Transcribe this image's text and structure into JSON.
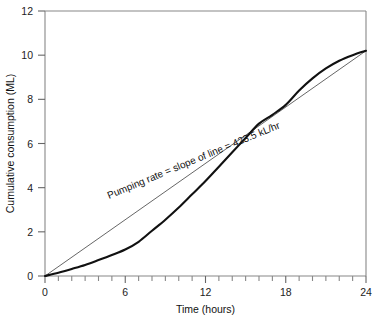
{
  "chart_data": {
    "type": "line",
    "title": "",
    "xlabel": "Time (hours)",
    "ylabel": "Cumulative consumption (ML)",
    "xlim": [
      0,
      24
    ],
    "ylim": [
      0,
      12
    ],
    "x_major_ticks": [
      0,
      6,
      12,
      18,
      24
    ],
    "x_minor_tick_step": 1,
    "y_major_ticks": [
      0,
      2,
      4,
      6,
      8,
      10,
      12
    ],
    "grid": false,
    "legend": "none",
    "x_tick_labels": [
      "0",
      "6",
      "12",
      "18",
      "24"
    ],
    "y_tick_labels": [
      "0",
      "2",
      "4",
      "6",
      "8",
      "10",
      "12"
    ],
    "series": [
      {
        "name": "Cumulative consumption curve",
        "style": "solid-thick",
        "color": "#111111",
        "x": [
          0,
          1,
          2,
          3,
          4,
          5,
          6,
          7,
          8,
          9,
          10,
          11,
          12,
          13,
          14,
          15,
          16,
          17,
          18,
          19,
          20,
          21,
          22,
          23,
          24
        ],
        "values": [
          0.0,
          0.15,
          0.32,
          0.5,
          0.72,
          0.95,
          1.2,
          1.55,
          2.05,
          2.55,
          3.1,
          3.7,
          4.3,
          4.95,
          5.6,
          6.25,
          6.9,
          7.3,
          7.75,
          8.4,
          8.95,
          9.4,
          9.75,
          10.0,
          10.2
        ]
      },
      {
        "name": "Average pumping rate chord",
        "style": "solid-thin",
        "color": "#555555",
        "x": [
          0,
          24
        ],
        "values": [
          0.0,
          10.2
        ]
      }
    ],
    "annotations": [
      {
        "name": "pumping-rate-annotation",
        "text": "Pumping rate = slope of line = 423.5 kL/hr",
        "x": 11.2,
        "y": 5.1,
        "rotation_deg": -22.5
      }
    ]
  }
}
